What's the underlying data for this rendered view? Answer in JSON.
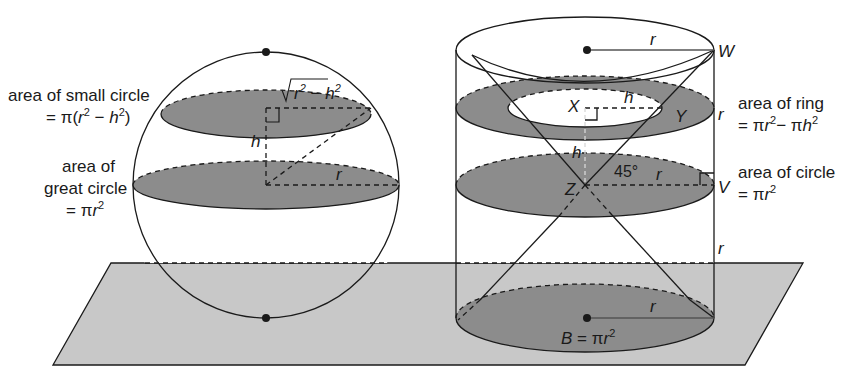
{
  "figure": {
    "colors": {
      "plane_fill": "#c8c8c8",
      "cross_section_fill": "#8c8c8c",
      "line": "#1a1a1a",
      "background": "#ffffff"
    }
  },
  "sphere": {
    "labels": {
      "small_circle_line1": "area of small circle",
      "small_circle_line2_prefix": "= π(",
      "small_circle_r": "r",
      "small_circle_exp1": "2",
      "small_circle_minus": " − ",
      "small_circle_h": "h",
      "small_circle_exp2": "2",
      "small_circle_close": ")",
      "great_circle_line1": "area of",
      "great_circle_line2": "great circle",
      "great_circle_line3_prefix": "= π",
      "great_circle_r": "r",
      "great_circle_exp": "2"
    },
    "segment_labels": {
      "sqrt_r": "r",
      "sqrt_exp1": "2",
      "sqrt_minus": " − ",
      "sqrt_h": "h",
      "sqrt_exp2": "2",
      "height": "h",
      "radius": "r"
    }
  },
  "cylinder": {
    "points": {
      "W": "W",
      "X": "X",
      "Y": "Y",
      "Z": "Z",
      "V": "V"
    },
    "segment_labels": {
      "top_radius": "r",
      "inner_radius": "h",
      "height_XZ": "h",
      "angle": "45°",
      "mid_radius": "r",
      "side_upper": "r",
      "side_lower": "r",
      "base_radius": "r"
    },
    "labels": {
      "ring_line1": "area of ring",
      "ring_line2_prefix": "= π",
      "ring_r": "r",
      "ring_exp1": "2",
      "ring_minus": "− π",
      "ring_h": "h",
      "ring_exp2": "2",
      "circle_line1": "area of circle",
      "circle_line2_prefix": "= π",
      "circle_r": "r",
      "circle_exp": "2",
      "base_B": "B",
      "base_eq": " = π",
      "base_r": "r",
      "base_exp": "2"
    }
  }
}
